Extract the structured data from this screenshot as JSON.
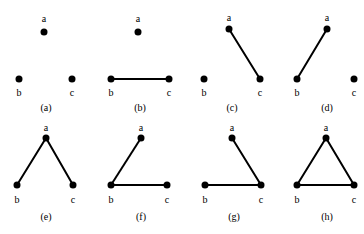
{
  "figure": {
    "width": 364,
    "height": 234,
    "background_color": "#ffffff",
    "ink_color": "#000000",
    "vertex_names": [
      "a",
      "b",
      "c"
    ],
    "node_radius": 3.5,
    "edge_width": 2,
    "columns": 4,
    "rows": 2,
    "panels": [
      {
        "caption": "(a)",
        "edges": [],
        "edge_count": 0,
        "labels": {
          "a": "a",
          "b": "b",
          "c": "c"
        },
        "origin": {
          "x": 0,
          "y": 0
        },
        "nodes": {
          "a": {
            "x": 44,
            "y": 32
          },
          "b": {
            "x": 19,
            "y": 79
          },
          "c": {
            "x": 72,
            "y": 79
          }
        },
        "label_pos": {
          "a": {
            "x": 44,
            "y": 14
          },
          "b": {
            "x": 19,
            "y": 88
          },
          "c": {
            "x": 72,
            "y": 88
          }
        },
        "caption_pos": {
          "x": 46,
          "y": 103
        }
      },
      {
        "caption": "(b)",
        "edges": [
          "bc"
        ],
        "edge_count": 1,
        "labels": {
          "a": "a",
          "b": "b",
          "c": "c"
        },
        "origin": {
          "x": 91,
          "y": 0
        },
        "nodes": {
          "a": {
            "x": 47,
            "y": 32
          },
          "b": {
            "x": 20,
            "y": 79
          },
          "c": {
            "x": 78,
            "y": 79
          }
        },
        "label_pos": {
          "a": {
            "x": 47,
            "y": 14
          },
          "b": {
            "x": 20,
            "y": 88
          },
          "c": {
            "x": 78,
            "y": 88
          }
        },
        "caption_pos": {
          "x": 49,
          "y": 103
        }
      },
      {
        "caption": "(c)",
        "edges": [
          "ac"
        ],
        "edge_count": 1,
        "labels": {
          "a": "a",
          "b": "b",
          "c": "c"
        },
        "origin": {
          "x": 182,
          "y": 0
        },
        "nodes": {
          "a": {
            "x": 47,
            "y": 29
          },
          "b": {
            "x": 22,
            "y": 79
          },
          "c": {
            "x": 78,
            "y": 79
          }
        },
        "label_pos": {
          "a": {
            "x": 47,
            "y": 13
          },
          "b": {
            "x": 22,
            "y": 88
          },
          "c": {
            "x": 78,
            "y": 88
          }
        },
        "caption_pos": {
          "x": 50,
          "y": 103
        }
      },
      {
        "caption": "(d)",
        "edges": [
          "ab"
        ],
        "edge_count": 1,
        "labels": {
          "a": "a",
          "b": "b",
          "c": "c"
        },
        "origin": {
          "x": 273,
          "y": 0
        },
        "nodes": {
          "a": {
            "x": 54,
            "y": 29
          },
          "b": {
            "x": 24,
            "y": 79
          },
          "c": {
            "x": 81,
            "y": 79
          }
        },
        "label_pos": {
          "a": {
            "x": 54,
            "y": 13
          },
          "b": {
            "x": 24,
            "y": 88
          },
          "c": {
            "x": 81,
            "y": 88
          }
        },
        "caption_pos": {
          "x": 54,
          "y": 103
        }
      },
      {
        "caption": "(e)",
        "edges": [
          "ab",
          "ac"
        ],
        "edge_count": 2,
        "labels": {
          "a": "a",
          "b": "b",
          "c": "c"
        },
        "origin": {
          "x": 0,
          "y": 117
        },
        "nodes": {
          "a": {
            "x": 46,
            "y": 21
          },
          "b": {
            "x": 17,
            "y": 68
          },
          "c": {
            "x": 73,
            "y": 68
          }
        },
        "label_pos": {
          "a": {
            "x": 46,
            "y": 6
          },
          "b": {
            "x": 17,
            "y": 78
          },
          "c": {
            "x": 73,
            "y": 78
          }
        },
        "caption_pos": {
          "x": 46,
          "y": 95
        }
      },
      {
        "caption": "(f)",
        "edges": [
          "ab",
          "bc"
        ],
        "edge_count": 2,
        "labels": {
          "a": "a",
          "b": "b",
          "c": "c"
        },
        "origin": {
          "x": 91,
          "y": 117
        },
        "nodes": {
          "a": {
            "x": 50,
            "y": 21
          },
          "b": {
            "x": 20,
            "y": 68
          },
          "c": {
            "x": 76,
            "y": 68
          }
        },
        "label_pos": {
          "a": {
            "x": 50,
            "y": 6
          },
          "b": {
            "x": 20,
            "y": 78
          },
          "c": {
            "x": 76,
            "y": 78
          }
        },
        "caption_pos": {
          "x": 50,
          "y": 95
        }
      },
      {
        "caption": "(g)",
        "edges": [
          "ac",
          "bc"
        ],
        "edge_count": 2,
        "labels": {
          "a": "a",
          "b": "b",
          "c": "c"
        },
        "origin": {
          "x": 182,
          "y": 117
        },
        "nodes": {
          "a": {
            "x": 50,
            "y": 21
          },
          "b": {
            "x": 23,
            "y": 68
          },
          "c": {
            "x": 79,
            "y": 68
          }
        },
        "label_pos": {
          "a": {
            "x": 50,
            "y": 6
          },
          "b": {
            "x": 23,
            "y": 78
          },
          "c": {
            "x": 79,
            "y": 78
          }
        },
        "caption_pos": {
          "x": 52,
          "y": 95
        }
      },
      {
        "caption": "(h)",
        "edges": [
          "ab",
          "ac",
          "bc"
        ],
        "edge_count": 3,
        "labels": {
          "a": "a",
          "b": "b",
          "c": "c"
        },
        "origin": {
          "x": 273,
          "y": 117
        },
        "nodes": {
          "a": {
            "x": 53,
            "y": 21
          },
          "b": {
            "x": 24,
            "y": 68
          },
          "c": {
            "x": 81,
            "y": 68
          }
        },
        "label_pos": {
          "a": {
            "x": 53,
            "y": 6
          },
          "b": {
            "x": 24,
            "y": 78
          },
          "c": {
            "x": 81,
            "y": 78
          }
        },
        "caption_pos": {
          "x": 54,
          "y": 95
        }
      }
    ]
  }
}
